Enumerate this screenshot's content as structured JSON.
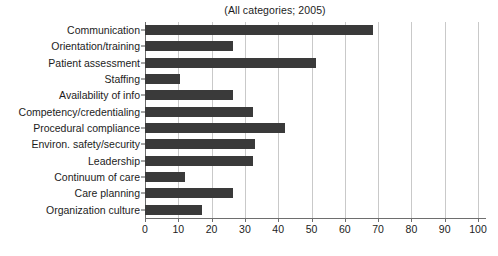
{
  "chart_data": {
    "type": "bar",
    "orientation": "horizontal",
    "title": "(All categories; 2005)",
    "xlabel": "",
    "ylabel": "",
    "xlim": [
      0,
      100
    ],
    "xticks": [
      0,
      10,
      20,
      30,
      40,
      50,
      60,
      70,
      80,
      90,
      100
    ],
    "xtick_labels": [
      "0",
      "10",
      "20",
      "30",
      "40",
      "50",
      "60",
      "70",
      "80",
      "90",
      "100"
    ],
    "grid": "vertical",
    "legend": "none",
    "bar_color": "#3a3a3a",
    "gridline_color": "#c9c9c9",
    "axis_color": "#6e6e6e",
    "categories": [
      "Communication",
      "Orientation/training",
      "Patient assessment",
      "Staffing",
      "Availability of info",
      "Competency/credentialing",
      "Procedural compliance",
      "Environ. safety/security",
      "Leadership",
      "Continuum of care",
      "Care planning",
      "Organization culture"
    ],
    "values": [
      68.5,
      26.5,
      51.5,
      10.5,
      26.5,
      32.5,
      42,
      33,
      32.5,
      12,
      26.5,
      17
    ]
  }
}
